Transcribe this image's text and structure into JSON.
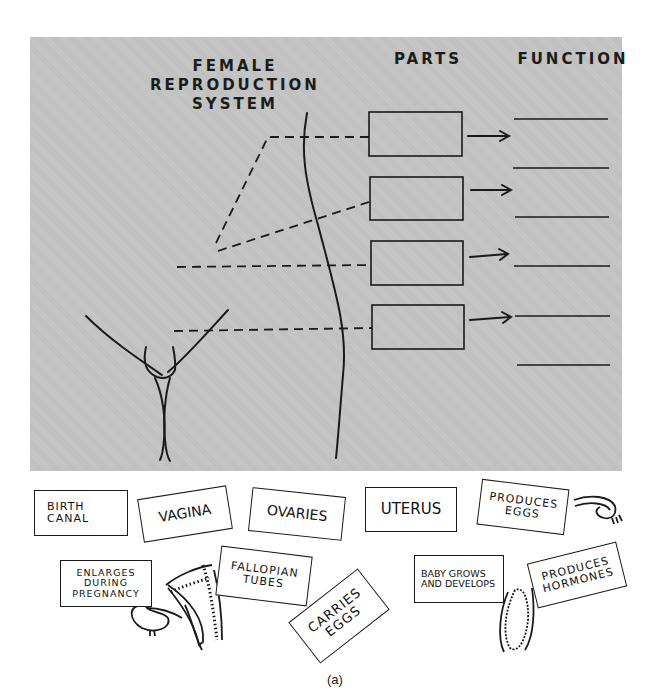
{
  "diagram": {
    "headings": {
      "system": "FEMALE\nREPRODUCTION\nSYSTEM",
      "parts": "PARTS",
      "function": "FUNCTION"
    },
    "part_boxes": [
      {
        "index": 1,
        "value": ""
      },
      {
        "index": 2,
        "value": ""
      },
      {
        "index": 3,
        "value": ""
      },
      {
        "index": 4,
        "value": ""
      }
    ],
    "function_lines": 6,
    "colors": {
      "panel": "#c4c4c4",
      "ink": "#1a1a1a",
      "card": "#ffffff"
    }
  },
  "cards": {
    "parts": [
      {
        "label": "Vagina"
      },
      {
        "label": "Ovaries"
      },
      {
        "label": "Uterus"
      },
      {
        "label": "Fallopian Tubes"
      }
    ],
    "functions": [
      {
        "label": "Birth Canal"
      },
      {
        "label": "Produces Eggs"
      },
      {
        "label": "Enlarges During Pregnancy"
      },
      {
        "label": "Carries Eggs"
      },
      {
        "label": "Baby Grows and Develops"
      },
      {
        "label": "Produces Hormones"
      }
    ]
  },
  "caption": "(a)"
}
